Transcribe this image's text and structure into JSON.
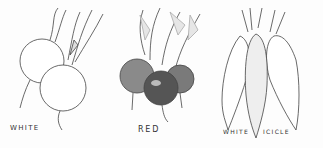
{
  "image": {
    "description": "Pencil illustration of three radish varieties",
    "labels": [
      {
        "text": "WHITE",
        "x": 10,
        "y": 124
      },
      {
        "text": "RED",
        "x": 138,
        "y": 126
      },
      {
        "text": "WHITE",
        "x": 223,
        "y": 128
      },
      {
        "text": "ICICLE",
        "x": 263,
        "y": 128
      }
    ],
    "colors": {
      "ink": "#333333",
      "red_radish": "#4a4a4a",
      "background": "#fdfdfd"
    }
  }
}
